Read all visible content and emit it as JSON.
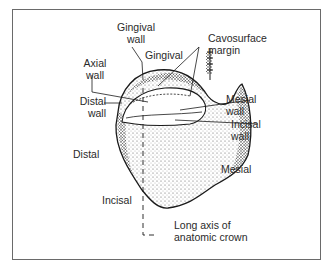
{
  "figure": {
    "labels": {
      "gingival_wall": [
        "Gingival",
        "wall"
      ],
      "gingival": "Gingival",
      "cavosurface_margin": [
        "Cavosurface",
        "margin"
      ],
      "axial_wall": [
        "Axial",
        "wall"
      ],
      "distal_wall": [
        "Distal",
        "wall"
      ],
      "mesial_wall": [
        "Mesial",
        "wall"
      ],
      "incisal_wall": [
        "Incisal",
        "wall"
      ],
      "distal": "Distal",
      "mesial": "Mesial",
      "incisal": "Incisal",
      "long_axis": [
        "Long axis of",
        "anatomic crown"
      ]
    },
    "colors": {
      "line": "#1a1a1a",
      "frame": "#6a6a6a",
      "stipple": "#3a3a3a"
    }
  }
}
